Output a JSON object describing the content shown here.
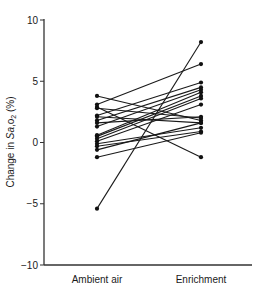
{
  "chart_data": {
    "type": "line",
    "subtype": "paired-slope",
    "title": "",
    "xlabel": "",
    "ylabel": "Change in Sa,o2 (%)",
    "ylabel_parts": {
      "prefix": "Change in ",
      "italic": "Sa",
      "comma": ",",
      "sub_base": "o",
      "sub": "2",
      "suffix": " (%)"
    },
    "categories": [
      "Ambient air",
      "Enrichment"
    ],
    "ylim": [
      -10,
      10
    ],
    "yticks": [
      -10,
      -5,
      0,
      5,
      10
    ],
    "ytick_labels": [
      "−10",
      "−5",
      "0",
      "5",
      "10"
    ],
    "grid": false,
    "legend": null,
    "series": [
      {
        "name": "subject-1",
        "values": [
          3.8,
          1.8
        ]
      },
      {
        "name": "subject-2",
        "values": [
          3.1,
          6.4
        ]
      },
      {
        "name": "subject-3",
        "values": [
          2.9,
          -1.2
        ]
      },
      {
        "name": "subject-4",
        "values": [
          2.8,
          2.0
        ]
      },
      {
        "name": "subject-5",
        "values": [
          2.2,
          4.9
        ]
      },
      {
        "name": "subject-6",
        "values": [
          2.1,
          1.6
        ]
      },
      {
        "name": "subject-7",
        "values": [
          1.8,
          4.5
        ]
      },
      {
        "name": "subject-8",
        "values": [
          1.6,
          2.1
        ]
      },
      {
        "name": "subject-9",
        "values": [
          1.3,
          4.3
        ]
      },
      {
        "name": "subject-10",
        "values": [
          0.6,
          4.1
        ]
      },
      {
        "name": "subject-11",
        "values": [
          0.5,
          3.8
        ]
      },
      {
        "name": "subject-12",
        "values": [
          0.3,
          3.6
        ]
      },
      {
        "name": "subject-13",
        "values": [
          0.1,
          3.1
        ]
      },
      {
        "name": "subject-14",
        "values": [
          -0.1,
          1.2
        ]
      },
      {
        "name": "subject-15",
        "values": [
          -0.3,
          0.9
        ]
      },
      {
        "name": "subject-16",
        "values": [
          -0.6,
          1.6
        ]
      },
      {
        "name": "subject-17",
        "values": [
          -1.2,
          0.8
        ]
      },
      {
        "name": "subject-18",
        "values": [
          -5.4,
          8.2
        ]
      }
    ]
  },
  "style": {
    "line_color": "#1a1a1a",
    "marker_color": "#111111",
    "axis_color": "#333333"
  }
}
